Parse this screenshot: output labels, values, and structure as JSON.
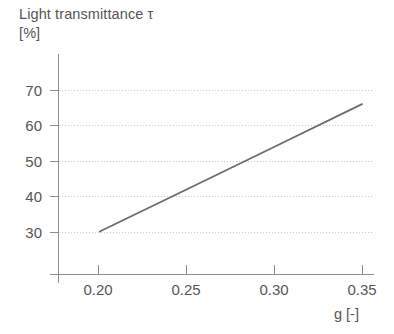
{
  "chart_data": {
    "type": "line",
    "title": "Light transmittance τ [%]",
    "title_line1": "Light transmittance τ",
    "title_line2": "[%]",
    "xlabel": "g [-]",
    "ylabel": "Light transmittance τ [%]",
    "xlim": [
      0.185,
      0.3655
    ],
    "ylim": [
      22.5,
      74
    ],
    "grid": "horizontal-dotted",
    "legend": "none",
    "line_color": "#6b6b6b",
    "grid_color": "#c9c9c9",
    "axis_color": "#8e8e8e",
    "text_color": "#565656",
    "x_ticks": [
      "0.20",
      "0.25",
      "0.30",
      "0.35"
    ],
    "x_tick_values": [
      0.2,
      0.25,
      0.3,
      0.35
    ],
    "y_ticks": [
      "70",
      "60",
      "50",
      "40",
      "30"
    ],
    "y_tick_values": [
      70,
      60,
      50,
      40,
      30
    ],
    "series": [
      {
        "name": "Light transmittance",
        "x": [
          0.201,
          0.35
        ],
        "values": [
          30,
          66
        ],
        "points": [
          {
            "x": 0.201,
            "y": 30
          },
          {
            "x": 0.25,
            "y": 41.8
          },
          {
            "x": 0.3,
            "y": 53.9
          },
          {
            "x": 0.35,
            "y": 66
          }
        ]
      }
    ]
  }
}
